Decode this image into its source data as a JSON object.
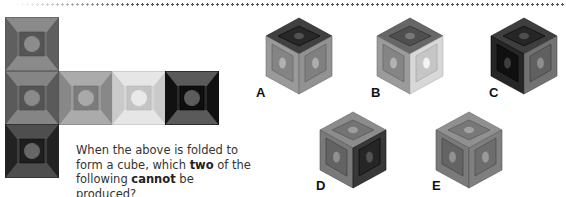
{
  "question": {
    "line1": "When the above is folded to",
    "line2_pre": "form a cube, which ",
    "line2_bold": "two",
    "line2_post": " of the",
    "line3_pre": "following ",
    "line3_bold": "cannot",
    "line3_post": " be produced?"
  },
  "net": {
    "tiles": [
      {
        "id": "top",
        "shade": "dark-gray",
        "outer": "#6e6e6e",
        "inner": "#555555",
        "bevel_top": "#8a8a8a",
        "bevel_side": "#5f5f5f",
        "moon": "#8c8c8c"
      },
      {
        "id": "row-1",
        "shade": "dark-gray",
        "outer": "#6a6a6a",
        "inner": "#545454",
        "bevel_top": "#858585",
        "bevel_side": "#5a5a5a",
        "moon": "#8a8a8a"
      },
      {
        "id": "row-2",
        "shade": "mid-gray",
        "outer": "#9a9a9a",
        "inner": "#7c7c7c",
        "bevel_top": "#ababab",
        "bevel_side": "#888888",
        "moon": "#a9a9a9"
      },
      {
        "id": "row-3",
        "shade": "light-gray",
        "outer": "#d6d6d6",
        "inner": "#c4c4c4",
        "bevel_top": "#e6e6e6",
        "bevel_side": "#cacaca",
        "moon": "#e9e9e9"
      },
      {
        "id": "row-4",
        "shade": "black",
        "outer": "#2a2a2a",
        "inner": "#0e0e0e",
        "bevel_top": "#5a5a5a",
        "bevel_side": "#111111",
        "moon": "#5c5c5c"
      },
      {
        "id": "bottom",
        "shade": "very-dark-gray",
        "outer": "#3d3d3d",
        "inner": "#1e1e1e",
        "bevel_top": "#4e4e4e",
        "bevel_side": "#222222",
        "moon": "#666666"
      }
    ]
  },
  "options": [
    {
      "label": "A",
      "top": "#2e2e2e",
      "left": "#8e8e8e",
      "right": "#8a8a8a"
    },
    {
      "label": "B",
      "top": "#555555",
      "left": "#8f8f8f",
      "right": "#d0d0d0"
    },
    {
      "label": "C",
      "top": "#2c2c2c",
      "left": "#1a1a1a",
      "right": "#6a6a6a"
    },
    {
      "label": "D",
      "top": "#7a7a7a",
      "left": "#6d6d6d",
      "right": "#303030"
    },
    {
      "label": "E",
      "top": "#7e7e7e",
      "left": "#6e6e6e",
      "right": "#777777"
    }
  ]
}
